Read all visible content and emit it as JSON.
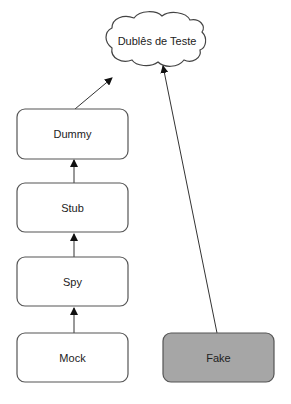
{
  "diagram": {
    "root": {
      "label": "Dublês de Teste",
      "shape": "cloud"
    },
    "nodes": [
      {
        "id": "dummy",
        "label": "Dummy",
        "fill": "#ffffff"
      },
      {
        "id": "stub",
        "label": "Stub",
        "fill": "#ffffff"
      },
      {
        "id": "spy",
        "label": "Spy",
        "fill": "#ffffff"
      },
      {
        "id": "mock",
        "label": "Mock",
        "fill": "#ffffff"
      },
      {
        "id": "fake",
        "label": "Fake",
        "fill": "#a6a6a6"
      }
    ],
    "edges": [
      {
        "from": "mock",
        "to": "spy"
      },
      {
        "from": "spy",
        "to": "stub"
      },
      {
        "from": "stub",
        "to": "dummy"
      },
      {
        "from": "dummy",
        "to": "root"
      },
      {
        "from": "fake",
        "to": "root"
      }
    ],
    "colors": {
      "stroke": "#555555",
      "fake_fill": "#a6a6a6",
      "background": "#ffffff"
    }
  }
}
